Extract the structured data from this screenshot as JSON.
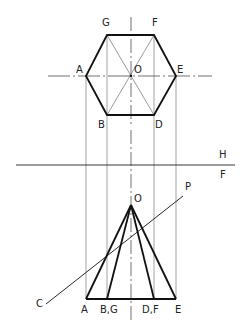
{
  "figure": {
    "type": "orthographic projection of hexagonal pyramid with cutting plane",
    "reference_line": {
      "upper": "H",
      "lower": "F"
    },
    "top_view": {
      "center": "O",
      "vertices": [
        "A",
        "B",
        "D",
        "E",
        "F",
        "G"
      ]
    },
    "front_view": {
      "apex": "O",
      "base_labels": [
        "A",
        "B,G",
        "D,F",
        "E"
      ],
      "cutting_plane": {
        "start": "C",
        "end": "P"
      }
    }
  },
  "labels": {
    "G": "G",
    "F": "F",
    "A": "A",
    "O_top": "O",
    "E": "E",
    "B": "B",
    "D": "D",
    "H": "H",
    "Fref": "F",
    "P": "P",
    "O_front": "O",
    "C": "C",
    "base_A": "A",
    "base_BG": "B,G",
    "base_DF": "D,F",
    "base_E": "E"
  },
  "colors": {
    "line": "#1a1a1a",
    "thin": "#555555"
  }
}
